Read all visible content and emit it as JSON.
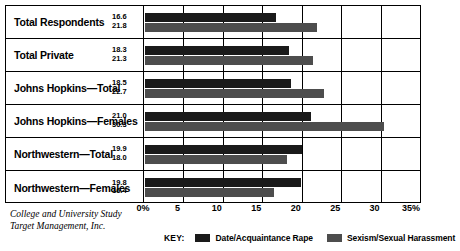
{
  "chart_data": {
    "type": "bar",
    "orientation": "horizontal",
    "title": "",
    "xlabel": "",
    "ylabel": "",
    "xlim": [
      0,
      35
    ],
    "grid": true,
    "legend_position": "bottom",
    "xticks": [
      "0%",
      "5",
      "10",
      "15",
      "20",
      "25",
      "30",
      "35%"
    ],
    "xtick_values": [
      0,
      5,
      10,
      15,
      20,
      25,
      30,
      35
    ],
    "categories": [
      "Total Respondents",
      "Total Private",
      "Johns Hopkins—Total",
      "Johns Hopkins—Females",
      "Northwestern—Total",
      "Northwestern—Females"
    ],
    "series": [
      {
        "name": "Date/Acquaintance Rape",
        "color": "#1a1a1a",
        "values": [
          16.6,
          18.3,
          18.5,
          21.0,
          19.9,
          19.8
        ]
      },
      {
        "name": "Sexism/Sexual Harassment",
        "color": "#4d4d4d",
        "values": [
          21.8,
          21.3,
          22.7,
          30.3,
          18.0,
          16.4
        ]
      }
    ],
    "value_labels": [
      {
        "top": "16.6",
        "bottom": "21.8"
      },
      {
        "top": "18.3",
        "bottom": "21.3"
      },
      {
        "top": "18.5",
        "bottom": "22.7"
      },
      {
        "top": "21.0",
        "bottom": "30.3"
      },
      {
        "top": "19.9",
        "bottom": "18.0"
      },
      {
        "top": "19.8",
        "bottom": "16.4"
      }
    ]
  },
  "legend": {
    "key_label": "KEY:",
    "items": [
      {
        "label": "Date/Acquaintance Rape",
        "color": "#1a1a1a"
      },
      {
        "label": "Sexism/Sexual Harassment",
        "color": "#4d4d4d"
      }
    ]
  },
  "source": {
    "line1": "College and University Study",
    "line2": "Target Management, Inc."
  }
}
